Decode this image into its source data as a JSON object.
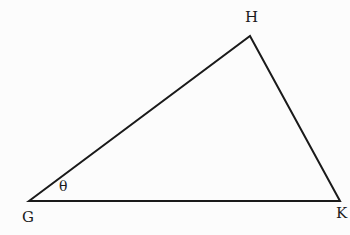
{
  "diagram": {
    "type": "triangle",
    "vertices": [
      {
        "name": "G",
        "label": "G"
      },
      {
        "name": "H",
        "label": "H"
      },
      {
        "name": "K",
        "label": "K"
      }
    ],
    "angle_label": "θ",
    "angle_at": "G",
    "line_color": "#1a1a1a",
    "background": "#fcfcfc"
  }
}
